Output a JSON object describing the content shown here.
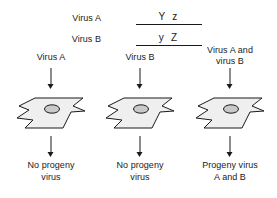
{
  "figure": {
    "legend": {
      "rows": [
        {
          "virus_label": "Virus A",
          "alleles": "Y z"
        },
        {
          "virus_label": "Virus B",
          "alleles": "y Z"
        }
      ]
    },
    "columns": [
      {
        "title": "Virus A",
        "result": "No progeny\nvirus",
        "cell_name": "host-cell"
      },
      {
        "title": "Virus B",
        "result": "No progeny\nvirus",
        "cell_name": "host-cell"
      },
      {
        "title": "Virus A and\nvirus B",
        "result": "Progeny virus\nA and B",
        "cell_name": "host-cell"
      }
    ],
    "colors": {
      "stroke": "#1a1a1a",
      "cell_fill": "#efefef",
      "nucleus_fill": "#c9c9c9",
      "background": "#ffffff"
    }
  }
}
